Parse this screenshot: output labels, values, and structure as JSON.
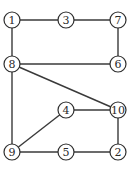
{
  "diagram": {
    "type": "undirected-graph",
    "colors": {
      "stroke": "#2e2e2e",
      "edge": "#3a3a3a",
      "fill": "#ffffff",
      "text": "#2a2a2a"
    },
    "node_radius": 8,
    "nodes": [
      {
        "id": "1",
        "label": "1",
        "x": 12,
        "y": 20
      },
      {
        "id": "3",
        "label": "3",
        "x": 66,
        "y": 20
      },
      {
        "id": "7",
        "label": "7",
        "x": 118,
        "y": 20
      },
      {
        "id": "8",
        "label": "8",
        "x": 12,
        "y": 64
      },
      {
        "id": "6",
        "label": "6",
        "x": 118,
        "y": 64
      },
      {
        "id": "4",
        "label": "4",
        "x": 66,
        "y": 110
      },
      {
        "id": "10",
        "label": "10",
        "x": 118,
        "y": 110
      },
      {
        "id": "9",
        "label": "9",
        "x": 12,
        "y": 152
      },
      {
        "id": "5",
        "label": "5",
        "x": 66,
        "y": 152
      },
      {
        "id": "2",
        "label": "2",
        "x": 118,
        "y": 152
      }
    ],
    "edges": [
      [
        "1",
        "3"
      ],
      [
        "3",
        "7"
      ],
      [
        "1",
        "8"
      ],
      [
        "7",
        "6"
      ],
      [
        "8",
        "6"
      ],
      [
        "8",
        "10"
      ],
      [
        "8",
        "9"
      ],
      [
        "4",
        "10"
      ],
      [
        "9",
        "4"
      ],
      [
        "10",
        "2"
      ],
      [
        "9",
        "5"
      ],
      [
        "5",
        "2"
      ]
    ]
  }
}
